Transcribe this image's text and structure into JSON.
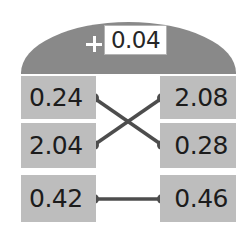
{
  "header": {
    "plus_icon": "plus-icon",
    "value_field": {
      "value": "0.04"
    }
  },
  "rows": [
    {
      "left": "0.24",
      "right": "2.08"
    },
    {
      "left": "2.04",
      "right": "0.28"
    },
    {
      "left": "0.42",
      "right": "0.46"
    }
  ],
  "connections": [
    {
      "from": "row1-left",
      "to": "row2-right"
    },
    {
      "from": "row2-left",
      "to": "row1-right"
    },
    {
      "from": "row3-left",
      "to": "row3-right"
    }
  ],
  "colors": {
    "dome": "#898989",
    "cell": "#bdbdbd",
    "wire": "#4d4d4d",
    "text": "#1c1c1c",
    "field_bg": "#ffffff",
    "background": "#ffffff"
  }
}
